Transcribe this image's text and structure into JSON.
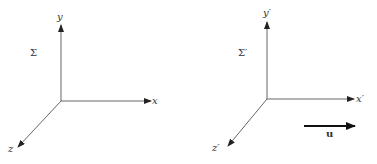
{
  "diagram": {
    "type": "two-reference-frames",
    "frames": [
      {
        "name": "Sigma",
        "frame_label": "Σ",
        "axes": {
          "x": "x",
          "y": "y",
          "z": "z"
        },
        "origin": [
          61,
          101
        ]
      },
      {
        "name": "Sigma-prime",
        "frame_label": "Σ′",
        "axes": {
          "x": "x′",
          "y": "y′",
          "z": "z′"
        },
        "origin": [
          267,
          99
        ]
      }
    ],
    "velocity": {
      "label": "u",
      "direction": "+x"
    },
    "colors": {
      "axis": "#555555",
      "velocity_arrow": "#111111",
      "text": "#333333"
    }
  }
}
